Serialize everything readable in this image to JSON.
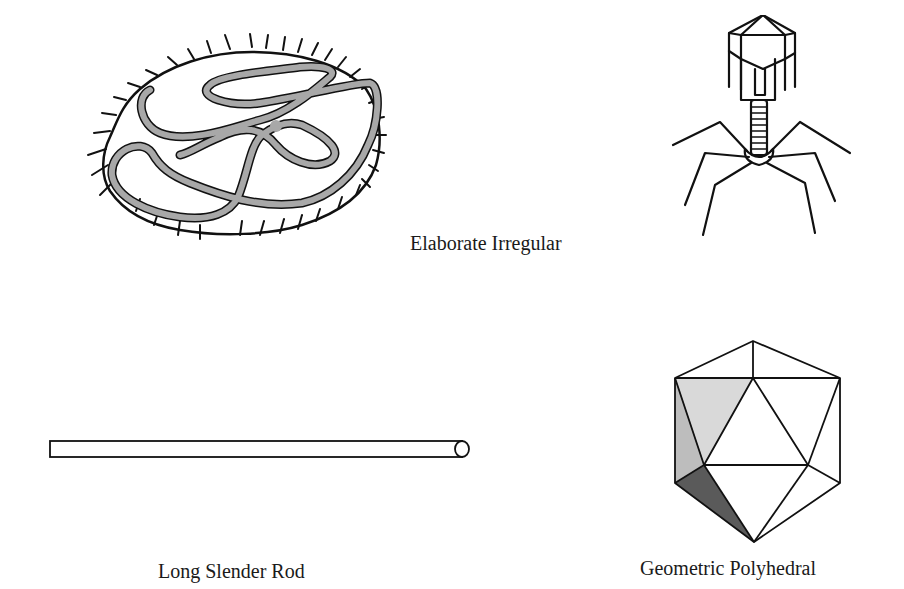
{
  "figures": [
    {
      "id": "elaborate-irregular",
      "caption": "Elaborate Irregular",
      "description": "Irregular enveloped virus with spikes and coiled nucleocapsid"
    },
    {
      "id": "bacteriophage",
      "caption": "",
      "description": "Complex bacteriophage with polyhedral head, helical tail and tail fibers"
    },
    {
      "id": "long-slender-rod",
      "caption": "Long Slender Rod",
      "description": "Helical rod-shaped virus"
    },
    {
      "id": "geometric-polyhedral",
      "caption": "Geometric Polyhedral",
      "description": "Icosahedral capsid"
    }
  ],
  "colors": {
    "stroke": "#111111",
    "nucleocapsid_fill": "#a8a8a8",
    "face_light": "#d9d9d9",
    "face_mid": "#bdbdbd",
    "face_dark": "#5a5a5a"
  }
}
